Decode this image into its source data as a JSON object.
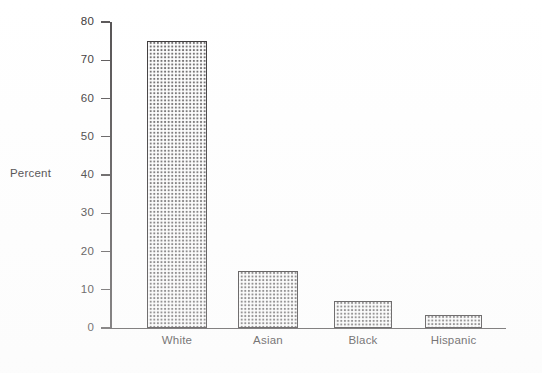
{
  "chart_data": {
    "type": "bar",
    "title": "",
    "subtitle": "",
    "xlabel": "",
    "ylabel": "Percent",
    "categories": [
      "White",
      "Asian",
      "Black",
      "Hispanic"
    ],
    "values": [
      75,
      15,
      7,
      3.5
    ],
    "series": [
      {
        "name": "Percent",
        "values": [
          75,
          15,
          7,
          3.5
        ]
      }
    ],
    "ylim": [
      0,
      80
    ],
    "y_ticks": [
      0,
      10,
      20,
      30,
      40,
      50,
      60,
      70,
      80
    ],
    "y_tick_labels": [
      "0",
      "10",
      "20",
      "30",
      "40",
      "50",
      "60",
      "70",
      "80"
    ],
    "grid": false,
    "legend": false,
    "legend_position": "none",
    "annotations": [],
    "bar_fill": "checkered-dot-pattern",
    "colors": {
      "bar_fill": "#6f6d6e",
      "bar_border": "#3a3738",
      "axis": "#4f4c4d",
      "text": "#3b3839",
      "background": "#ffffff"
    }
  },
  "axis": {
    "y_title": "Percent"
  }
}
